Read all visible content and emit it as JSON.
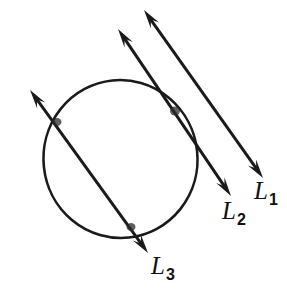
{
  "figure": {
    "background_color": "#ffffff",
    "stroke_color": "#1a1a1a",
    "width": 287,
    "height": 290,
    "circle": {
      "name": "circle",
      "cx": 120.5,
      "cy": 159,
      "r": 78,
      "rx": 77,
      "ry": 79,
      "stroke_width": 2.6,
      "fill": "none"
    },
    "lines": [
      {
        "id": "L1",
        "label": "L",
        "subscript": "1",
        "relation_to_circle": "does not intersect",
        "start_x": 144,
        "start_y": 10,
        "end_x": 263,
        "end_y": 178,
        "stroke_width": 3.0,
        "arrow_start": true,
        "arrow_end": true,
        "label_x": 254,
        "label_y": 178
      },
      {
        "id": "L2",
        "label": "L",
        "subscript": "2",
        "relation_to_circle": "tangent",
        "start_x": 118,
        "start_y": 29,
        "end_x": 231,
        "end_y": 196,
        "stroke_width": 3.0,
        "arrow_start": true,
        "arrow_end": true,
        "label_x": 222,
        "label_y": 198
      },
      {
        "id": "L3",
        "label": "L",
        "subscript": "3",
        "relation_to_circle": "secant",
        "start_x": 30,
        "start_y": 90,
        "end_x": 148,
        "end_y": 253,
        "stroke_width": 3.0,
        "arrow_start": true,
        "arrow_end": true,
        "label_x": 151,
        "label_y": 253
      }
    ],
    "marked_points": [
      {
        "id": "tangent-point",
        "x": 175,
        "y": 111,
        "on_line": "L2"
      },
      {
        "id": "secant-entry-point",
        "x": 56,
        "y": 122,
        "on_line": "L3"
      },
      {
        "id": "secant-exit-point",
        "x": 131,
        "y": 227,
        "on_line": "L3"
      }
    ]
  }
}
